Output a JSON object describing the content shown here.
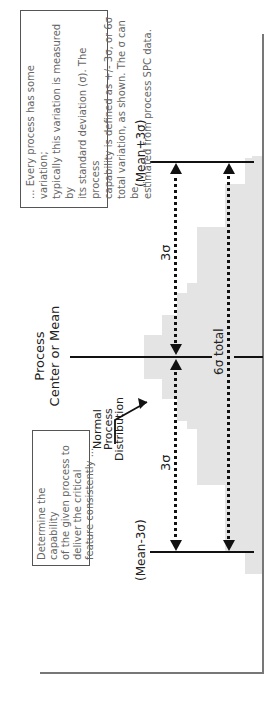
{
  "diagram": {
    "title": "Process Capability",
    "intro_note": "Determine the capability of the given process to deliver the critical feature consistently ...",
    "intro_note_lines": [
      "Determine the capability",
      "of the given process to",
      "deliver the critical",
      "feature consistently ..."
    ],
    "explain_note_lines": [
      "... Every process has some variation;",
      "typically this variation is measured by",
      "its standard deviation (σ). The process",
      "capability is defined as +/- 3σ, or 6σ",
      "total variation, as shown. The σ can be",
      "estimated from process SPC data."
    ],
    "center_label_line1": "Process",
    "center_label_line2": "Center or Mean",
    "distribution_label_lines": [
      "Normal",
      "Process",
      "Distribution"
    ],
    "lower_limit_label": "(Mean-3σ)",
    "upper_limit_label": "(Mean+3σ)",
    "lower_half_label": "3σ",
    "upper_half_label": "3σ",
    "total_label": "6σ total"
  },
  "colors": {
    "histogram_fill": "#e4e4e4",
    "line": "#111111",
    "axis": "#777777",
    "note_border": "#555555",
    "note_text": "#666666"
  },
  "histogram_bins": [
    {
      "left": 130,
      "width": 23,
      "height": 17
    },
    {
      "left": 153,
      "width": 66,
      "height": 37
    },
    {
      "left": 219,
      "width": 56,
      "height": 65
    },
    {
      "left": 275,
      "width": 8,
      "height": 75
    },
    {
      "left": 283,
      "width": 22,
      "height": 85
    },
    {
      "left": 305,
      "width": 20,
      "height": 100
    },
    {
      "left": 325,
      "width": 22,
      "height": 118
    },
    {
      "left": 347,
      "width": 22,
      "height": 118
    },
    {
      "left": 369,
      "width": 20,
      "height": 100
    },
    {
      "left": 389,
      "width": 22,
      "height": 85
    },
    {
      "left": 411,
      "width": 10,
      "height": 75
    },
    {
      "left": 421,
      "width": 56,
      "height": 65
    },
    {
      "left": 477,
      "width": 43,
      "height": 37
    },
    {
      "left": 520,
      "width": 26,
      "height": 17
    },
    {
      "left": 546,
      "width": 2,
      "height": 10
    }
  ]
}
